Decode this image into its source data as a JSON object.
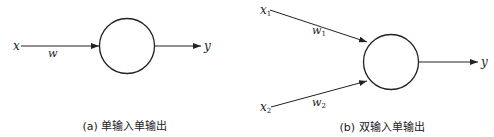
{
  "diagram_a": {
    "input_label": "x",
    "weight_label": "w",
    "output_label": "y",
    "caption": "(a) 单输入单输出"
  },
  "diagram_b": {
    "input1_label": "x",
    "input1_sub": "1",
    "weight1_label": "w",
    "weight1_sub": "1",
    "input2_label": "x",
    "input2_sub": "2",
    "weight2_label": "w",
    "weight2_sub": "2",
    "output_label": "y",
    "caption": "(b) 双输入单输出"
  },
  "colors": {
    "stroke": "#222222",
    "background": "#ffffff"
  }
}
